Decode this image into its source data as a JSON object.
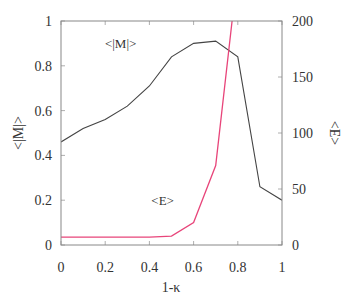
{
  "chart_data": {
    "type": "line",
    "title": "",
    "xlabel": "1-κ",
    "ylabel_left": "<|M|>",
    "ylabel_right": "<E>",
    "xlim": [
      0,
      1
    ],
    "ylim_left": [
      0,
      1
    ],
    "ylim_right": [
      0,
      200
    ],
    "grid": false,
    "legend": "inline annotations",
    "x_ticks": [
      "0",
      "0.2",
      "0.4",
      "0.6",
      "0.8",
      "1"
    ],
    "y_left_ticks": [
      "0",
      "0.2",
      "0.4",
      "0.6",
      "0.8",
      "1"
    ],
    "y_right_ticks": [
      "0",
      "50",
      "100",
      "150",
      "200"
    ],
    "x": [
      0,
      0.1,
      0.2,
      0.3,
      0.4,
      0.5,
      0.6,
      0.7,
      0.8,
      0.9,
      1.0
    ],
    "series": [
      {
        "name": "<|M|>",
        "axis": "left",
        "color": "#444444",
        "values": [
          0.46,
          0.52,
          0.56,
          0.62,
          0.71,
          0.84,
          0.9,
          0.91,
          0.84,
          0.26,
          0.2
        ]
      },
      {
        "name": "<E>",
        "axis": "right",
        "color": "#e8457a",
        "values": [
          7,
          7,
          7,
          7,
          7,
          8,
          20,
          71,
          245,
          null,
          null
        ]
      }
    ],
    "annotations": [
      {
        "text": "<|M|>",
        "x": 0.27,
        "y_left": 0.9
      },
      {
        "text": "<E>",
        "x": 0.46,
        "y_left": 0.2
      }
    ]
  }
}
